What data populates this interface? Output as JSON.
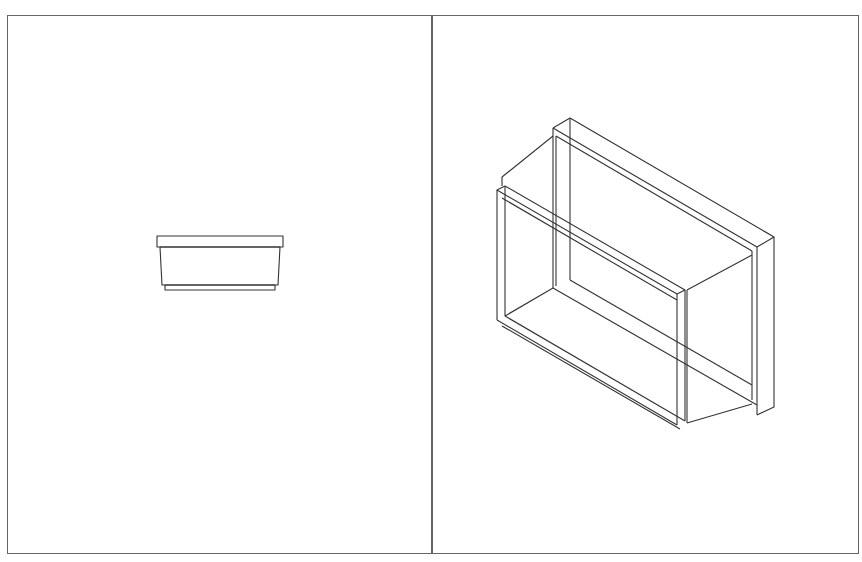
{
  "drawing": {
    "layout": "two-viewport",
    "viewports": [
      {
        "name": "front-view",
        "description": "Orthographic front elevation of a tray/box with top lip and bottom base step"
      },
      {
        "name": "isometric-view",
        "description": "Isometric wireframe of a rectangular box with front flange frame and rear flange frame"
      }
    ],
    "colors": {
      "background": "#ffffff",
      "line": "#333333",
      "border": "#666666"
    }
  }
}
